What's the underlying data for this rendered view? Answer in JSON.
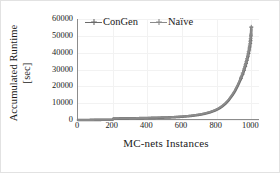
{
  "chart_data": {
    "type": "line",
    "title": "",
    "xlabel": "MC-nets Instances",
    "ylabel": "Accumulated Runtime [sec]",
    "ylabel_line1": "Accumulated Runtime",
    "ylabel_line2": "[sec]",
    "xlim": [
      0,
      1050
    ],
    "ylim": [
      0,
      60000
    ],
    "xticks": [
      0,
      200,
      400,
      600,
      800,
      1000
    ],
    "xtick_labels": [
      "0",
      "200",
      "400",
      "600",
      "800",
      "1000"
    ],
    "yticks": [
      0,
      10000,
      20000,
      30000,
      40000,
      50000,
      60000
    ],
    "ytick_labels": [
      "0",
      "10000",
      "20000",
      "30000",
      "40000",
      "50000",
      "60000"
    ],
    "grid": true,
    "grid_color": "#f2f2f2",
    "legend_position": "top-left-inside",
    "series": [
      {
        "name": "ConGen",
        "color": "#6b6b6b",
        "marker": "cross",
        "x": [
          0,
          50,
          100,
          150,
          190,
          200,
          205,
          250,
          300,
          350,
          400,
          450,
          500,
          550,
          600,
          650,
          700,
          730,
          760,
          790,
          810,
          830,
          850,
          870,
          890,
          905,
          920,
          930,
          940,
          950,
          958,
          965,
          970,
          975,
          980,
          984,
          988,
          991,
          994,
          996,
          998,
          1000
        ],
        "values": [
          0,
          30,
          70,
          120,
          170,
          190,
          900,
          950,
          1000,
          1080,
          1180,
          1300,
          1450,
          1650,
          1950,
          2400,
          3100,
          3700,
          4500,
          5600,
          6600,
          7900,
          9600,
          11800,
          14600,
          17000,
          20000,
          22200,
          24600,
          27200,
          29500,
          31800,
          33600,
          35500,
          37600,
          39500,
          41600,
          43400,
          45500,
          47300,
          50000,
          55000
        ]
      },
      {
        "name": "Naïve",
        "color": "#8a8a8a",
        "marker": "cross",
        "x": [
          0,
          50,
          100,
          150,
          190,
          200,
          205,
          250,
          300,
          350,
          400,
          450,
          500,
          550,
          600,
          650,
          700,
          730,
          760,
          790,
          810,
          830,
          850,
          870,
          890,
          905,
          920,
          930,
          940,
          950,
          958,
          965,
          970,
          975,
          980,
          984,
          988,
          991,
          994,
          996,
          998,
          1000
        ],
        "values": [
          0,
          35,
          80,
          135,
          185,
          205,
          940,
          990,
          1050,
          1140,
          1250,
          1380,
          1540,
          1750,
          2070,
          2540,
          3280,
          3900,
          4750,
          5900,
          6950,
          8300,
          10050,
          12300,
          15200,
          17700,
          20700,
          22950,
          25400,
          28000,
          30350,
          32700,
          34550,
          36500,
          38600,
          40550,
          42700,
          44500,
          46600,
          48400,
          51000,
          55400
        ]
      }
    ]
  },
  "legend": {
    "items": [
      {
        "label": "ConGen",
        "color": "#6b6b6b"
      },
      {
        "label": "Naïve",
        "color": "#8a8a8a"
      }
    ]
  },
  "axes": {
    "x_title": "MC-nets Instances",
    "y_title_line1": "Accumulated Runtime",
    "y_title_line2": "[sec]"
  }
}
